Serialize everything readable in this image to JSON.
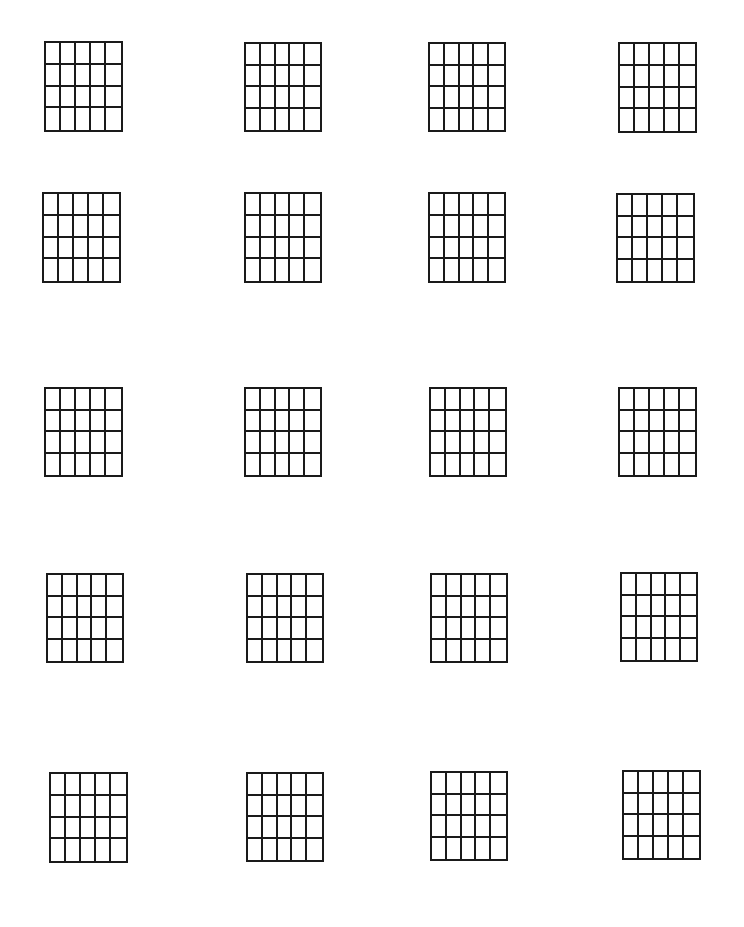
{
  "page": {
    "background": "#ffffff",
    "line_color": "#1a1a1a"
  },
  "grid_spec": {
    "columns": 5,
    "rows": 4,
    "count": 20,
    "layout_rows": 5,
    "layout_columns": 4
  },
  "grids": [
    {
      "id": 1,
      "x": 44,
      "y": 41,
      "w": 79,
      "h": 91
    },
    {
      "id": 2,
      "x": 244,
      "y": 42,
      "w": 78,
      "h": 90
    },
    {
      "id": 3,
      "x": 428,
      "y": 42,
      "w": 78,
      "h": 90
    },
    {
      "id": 4,
      "x": 618,
      "y": 42,
      "w": 79,
      "h": 91
    },
    {
      "id": 5,
      "x": 42,
      "y": 192,
      "w": 79,
      "h": 91
    },
    {
      "id": 6,
      "x": 244,
      "y": 192,
      "w": 78,
      "h": 91
    },
    {
      "id": 7,
      "x": 428,
      "y": 192,
      "w": 78,
      "h": 91
    },
    {
      "id": 8,
      "x": 616,
      "y": 193,
      "w": 79,
      "h": 90
    },
    {
      "id": 9,
      "x": 44,
      "y": 387,
      "w": 79,
      "h": 90
    },
    {
      "id": 10,
      "x": 244,
      "y": 387,
      "w": 78,
      "h": 90
    },
    {
      "id": 11,
      "x": 429,
      "y": 387,
      "w": 78,
      "h": 90
    },
    {
      "id": 12,
      "x": 618,
      "y": 387,
      "w": 79,
      "h": 90
    },
    {
      "id": 13,
      "x": 46,
      "y": 573,
      "w": 78,
      "h": 90
    },
    {
      "id": 14,
      "x": 246,
      "y": 573,
      "w": 78,
      "h": 90
    },
    {
      "id": 15,
      "x": 430,
      "y": 573,
      "w": 78,
      "h": 90
    },
    {
      "id": 16,
      "x": 620,
      "y": 572,
      "w": 78,
      "h": 90
    },
    {
      "id": 17,
      "x": 49,
      "y": 772,
      "w": 79,
      "h": 91
    },
    {
      "id": 18,
      "x": 246,
      "y": 772,
      "w": 78,
      "h": 90
    },
    {
      "id": 19,
      "x": 430,
      "y": 771,
      "w": 78,
      "h": 90
    },
    {
      "id": 20,
      "x": 622,
      "y": 770,
      "w": 79,
      "h": 90
    }
  ]
}
